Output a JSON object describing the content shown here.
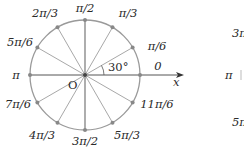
{
  "diagram": {
    "origin_label": "O",
    "angle_marker": "30°",
    "axis_label": "x",
    "colors": {
      "circle": "#9a9a9a",
      "spokes": "#9a9a9a",
      "text": "#2a2a2a",
      "axis": "#555555"
    },
    "angles": [
      {
        "deg": 0,
        "label": "0"
      },
      {
        "deg": 30,
        "label": "π/6"
      },
      {
        "deg": 60,
        "label": "π/3"
      },
      {
        "deg": 90,
        "label": "π/2"
      },
      {
        "deg": 120,
        "label": "2π/3"
      },
      {
        "deg": 150,
        "label": "5π/6"
      },
      {
        "deg": 180,
        "label": "π"
      },
      {
        "deg": 210,
        "label": "7π/6"
      },
      {
        "deg": 240,
        "label": "4π/3"
      },
      {
        "deg": 270,
        "label": "3π/2"
      },
      {
        "deg": 300,
        "label": "5π/3"
      },
      {
        "deg": 330,
        "label": "11π/6"
      }
    ],
    "partial_second_diagram": {
      "labels": [
        "3π",
        "π",
        "5π"
      ]
    }
  }
}
